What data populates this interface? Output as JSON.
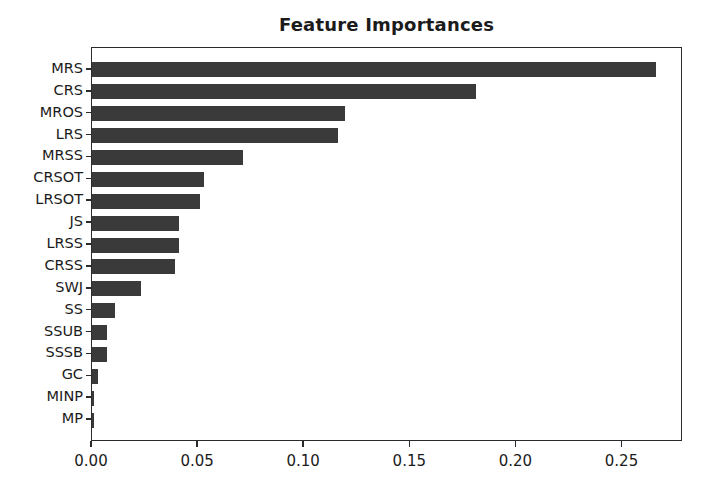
{
  "chart_data": {
    "type": "bar",
    "orientation": "horizontal",
    "title": "Feature Importances",
    "xlabel": "",
    "ylabel": "",
    "xlim": [
      0.0,
      0.2785
    ],
    "grid": false,
    "legend": null,
    "bar_color": "#3a3a3a",
    "axis_color": "#2b2b2b",
    "background_color": "#ffffff",
    "xticks": [
      "0.00",
      "0.05",
      "0.10",
      "0.15",
      "0.20",
      "0.25"
    ],
    "xtick_values": [
      0.0,
      0.05,
      0.1,
      0.15,
      0.2,
      0.25
    ],
    "categories": [
      "MRS",
      "CRS",
      "MROS",
      "LRS",
      "MRSS",
      "CRSOT",
      "LRSOT",
      "JS",
      "LRSS",
      "CRSS",
      "SWJ",
      "SS",
      "SSUB",
      "SSSB",
      "GC",
      "MINP",
      "MP"
    ],
    "values": [
      0.266,
      0.181,
      0.119,
      0.116,
      0.071,
      0.053,
      0.051,
      0.041,
      0.041,
      0.039,
      0.023,
      0.011,
      0.007,
      0.007,
      0.003,
      0.001,
      0.001
    ]
  },
  "figure": {
    "title": "Feature Importances"
  }
}
